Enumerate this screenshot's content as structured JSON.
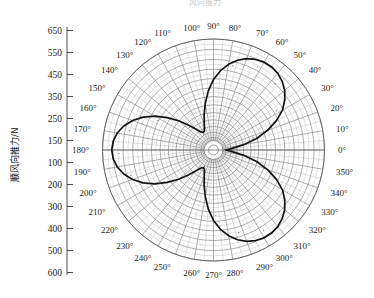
{
  "figure": {
    "title_fragment": "风向推力",
    "background": "#ffffff",
    "curve_color": "#111111",
    "grid_color": "#8a8a8a",
    "grid_minor_color": "#b5b5b5",
    "text_color": "#1c1c1c"
  },
  "yaxis": {
    "label": "顺风向推力/N",
    "ticks": [
      "650",
      "550",
      "450",
      "350",
      "250",
      "150",
      "100",
      "200",
      "300",
      "400",
      "500",
      "600"
    ]
  },
  "polar": {
    "angle_labels": [
      "0°",
      "10°",
      "20°",
      "30°",
      "40°",
      "50°",
      "60°",
      "70°",
      "80°",
      "90°",
      "100°",
      "110°",
      "120°",
      "130°",
      "140°",
      "150°",
      "160°",
      "170°",
      "180°",
      "190°",
      "200°",
      "210°",
      "220°",
      "230°",
      "240°",
      "250°",
      "260°",
      "270°",
      "280°",
      "290°",
      "300°",
      "310°",
      "320°",
      "330°",
      "340°",
      "350°"
    ]
  },
  "chart_data": {
    "type": "line",
    "subtype": "polar",
    "xlabel": "风向角 / °",
    "ylabel": "顺风向推力/N",
    "rlim": [
      100,
      650
    ],
    "grid": true,
    "legend": "none",
    "radial_ticks": [
      100,
      150,
      250,
      350,
      450,
      550,
      650
    ],
    "angular_tick_step_deg": 10,
    "angular_minor_step_deg": 5,
    "series": [
      {
        "name": "顺风向推力",
        "theta_deg": [
          0,
          5,
          10,
          15,
          20,
          25,
          30,
          35,
          40,
          45,
          50,
          55,
          60,
          65,
          70,
          75,
          80,
          85,
          90,
          95,
          100,
          105,
          110,
          115,
          120,
          125,
          130,
          135,
          140,
          145,
          150,
          155,
          160,
          165,
          170,
          175,
          180,
          185,
          190,
          195,
          200,
          205,
          210,
          215,
          220,
          225,
          230,
          235,
          240,
          245,
          250,
          255,
          260,
          265,
          270,
          275,
          280,
          285,
          290,
          295,
          300,
          305,
          310,
          315,
          320,
          325,
          330,
          335,
          340,
          345,
          350,
          355,
          360
        ],
        "r": [
          115,
          150,
          215,
          290,
          360,
          425,
          480,
          520,
          552,
          575,
          590,
          598,
          598,
          590,
          575,
          552,
          520,
          480,
          430,
          370,
          305,
          245,
          195,
          165,
          158,
          168,
          195,
          238,
          295,
          355,
          415,
          470,
          515,
          552,
          578,
          594,
          600,
          594,
          578,
          552,
          515,
          470,
          415,
          355,
          295,
          238,
          195,
          168,
          158,
          165,
          195,
          245,
          305,
          370,
          430,
          480,
          520,
          552,
          575,
          590,
          598,
          598,
          590,
          575,
          552,
          520,
          480,
          425,
          360,
          290,
          215,
          150,
          115
        ]
      }
    ],
    "lobes": [
      {
        "peak_angle_deg": 57,
        "peak_r": 598
      },
      {
        "peak_angle_deg": 180,
        "peak_r": 600
      },
      {
        "peak_angle_deg": 302,
        "peak_r": 598
      }
    ],
    "notches": [
      {
        "angle_deg": 120,
        "r": 158
      },
      {
        "angle_deg": 240,
        "r": 158
      },
      {
        "angle_deg": 0,
        "r": 115
      }
    ]
  }
}
